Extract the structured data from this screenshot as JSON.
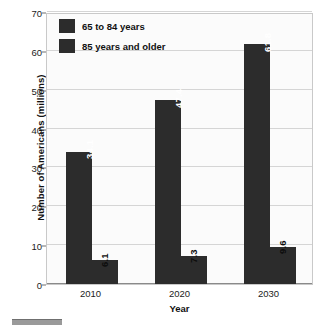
{
  "chart_data": {
    "type": "bar",
    "title": "",
    "subtitle": "",
    "xlabel": "Year",
    "ylabel": "Number of Americans (millions)",
    "categories": [
      "2010",
      "2020",
      "2030"
    ],
    "series": [
      {
        "name": "65 to 84 years",
        "values": [
          34.1,
          47.4,
          61.8
        ],
        "color": "#2c2c2c",
        "label_position": "inside"
      },
      {
        "name": "85 years and older",
        "values": [
          6.1,
          7.3,
          9.6
        ],
        "color": "#2c2c2c",
        "label_position": "outside"
      }
    ],
    "value_labels": {
      "series_0": [
        "34.1",
        "47.4",
        "61.8"
      ],
      "series_1": [
        "6.1",
        "7.3",
        "9.6"
      ]
    },
    "ylim": [
      0,
      70
    ],
    "yticks": [
      0,
      10,
      20,
      30,
      40,
      50,
      60,
      70
    ],
    "ytick_labels": [
      "0",
      "10",
      "20",
      "30",
      "40",
      "50",
      "60",
      "70"
    ],
    "grid": true,
    "grid_axis": "y",
    "legend_position": "top-left",
    "label_orientation": "vertical",
    "background_color": "#fbfbfb",
    "gridline_color": "#d5d5d5"
  },
  "legend": {
    "items": [
      {
        "label": "65 to 84 years"
      },
      {
        "label": "85 years and older"
      }
    ]
  },
  "axes": {
    "y_title": "Number of Americans (millions)",
    "x_title": "Year"
  }
}
